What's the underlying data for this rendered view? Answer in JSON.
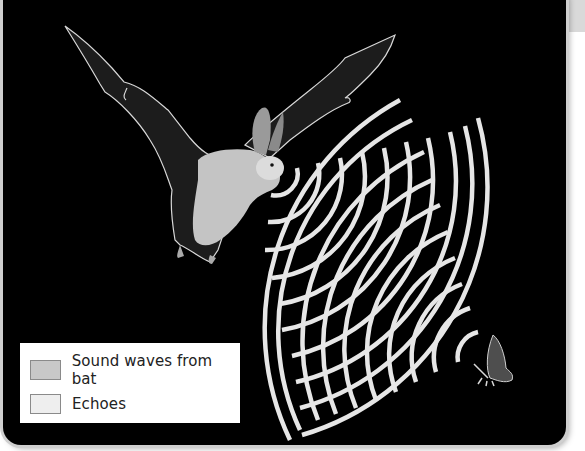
{
  "figure": {
    "colors": {
      "background": "#000000",
      "panel_border": "#cfcfcf",
      "tab": "#d9d9d9",
      "waves": "#e6e6e6",
      "bat_body": "#cfcfcf",
      "bat_wing": "#1f1f1f",
      "moth": "#555555"
    },
    "illustrations": [
      "bat",
      "moth"
    ],
    "sound_wave_arc_count": 10,
    "echo_arc_count": 10
  },
  "legend": {
    "items": [
      {
        "label": "Sound waves from bat",
        "swatch_color": "#c8c8c8"
      },
      {
        "label": "Echoes",
        "swatch_color": "#eeeeee"
      }
    ]
  }
}
